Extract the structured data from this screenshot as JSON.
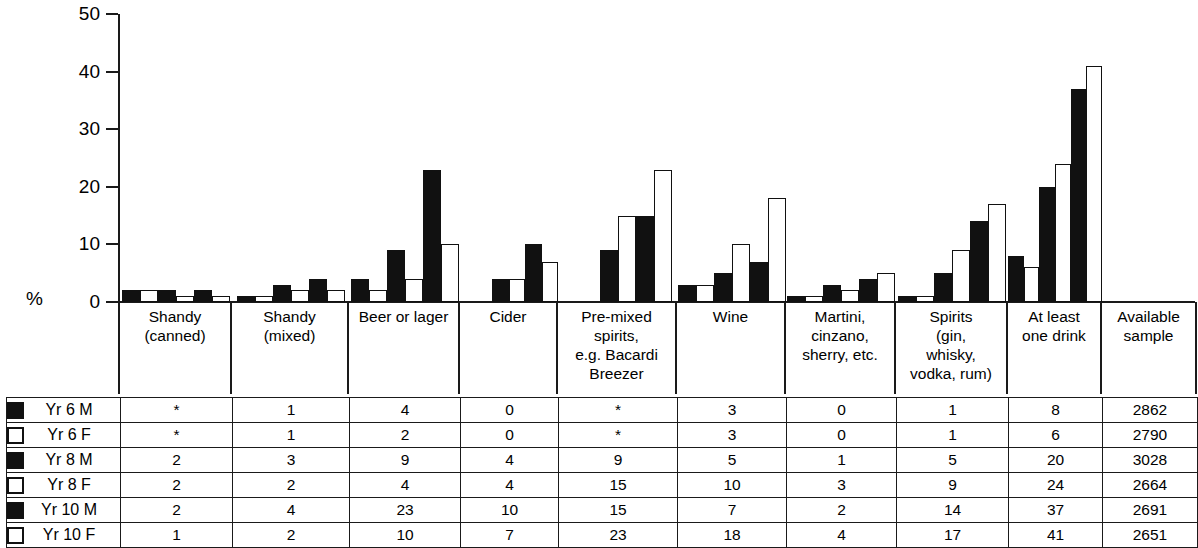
{
  "chart_data": {
    "type": "bar",
    "title": "",
    "subtitle": "",
    "xlabel": "",
    "ylabel": "%",
    "ylim": [
      0,
      50
    ],
    "yticks": [
      0,
      10,
      20,
      30,
      40,
      50
    ],
    "grid": false,
    "legend_position": "table-left",
    "orientation": "vertical-grouped",
    "categories": [
      "Shandy (canned)",
      "Shandy (mixed)",
      "Beer or lager",
      "Cider",
      "Pre-mixed spirits, e.g. Bacardi Breezer",
      "Wine",
      "Martini, cinzano, sherry, etc.",
      "Spirits (gin, whisky, vodka, rum)",
      "At least one drink"
    ],
    "series": [
      {
        "name": "Yr 6 M",
        "fill": "black",
        "values": [
          2,
          1,
          4,
          0,
          0,
          3,
          1,
          1,
          8
        ]
      },
      {
        "name": "Yr 6 F",
        "fill": "white",
        "values": [
          2,
          1,
          2,
          0,
          0,
          3,
          1,
          1,
          6
        ]
      },
      {
        "name": "Yr 8 M",
        "fill": "black",
        "values": [
          2,
          3,
          9,
          4,
          9,
          5,
          3,
          5,
          20
        ]
      },
      {
        "name": "Yr 8 F",
        "fill": "white",
        "values": [
          1,
          2,
          4,
          4,
          15,
          10,
          2,
          9,
          24
        ]
      },
      {
        "name": "Yr 10 M",
        "fill": "black",
        "values": [
          2,
          4,
          23,
          10,
          15,
          7,
          4,
          14,
          37
        ]
      },
      {
        "name": "Yr 10 F",
        "fill": "white",
        "values": [
          1,
          2,
          10,
          7,
          23,
          18,
          5,
          17,
          41
        ]
      }
    ]
  },
  "axis": {
    "percent_symbol": "%",
    "ticks": [
      {
        "label": "50"
      },
      {
        "label": "40"
      },
      {
        "label": "30"
      },
      {
        "label": "20"
      },
      {
        "label": "10"
      },
      {
        "label": "0"
      }
    ]
  },
  "categories": [
    {
      "lines": [
        "Shandy",
        "(canned)"
      ]
    },
    {
      "lines": [
        "Shandy",
        "(mixed)"
      ]
    },
    {
      "lines": [
        "Beer or lager"
      ]
    },
    {
      "lines": [
        "Cider"
      ]
    },
    {
      "lines": [
        "Pre-mixed",
        "spirits,",
        "e.g. Bacardi",
        "Breezer"
      ]
    },
    {
      "lines": [
        "Wine"
      ]
    },
    {
      "lines": [
        "Martini,",
        "cinzano,",
        "sherry,  etc."
      ]
    },
    {
      "lines": [
        "Spirits",
        "(gin,",
        "whisky,",
        "vodka, rum)"
      ]
    },
    {
      "lines": [
        "At least",
        "one drink"
      ]
    },
    {
      "lines": [
        "Available",
        "sample"
      ]
    }
  ],
  "table": {
    "rows": [
      {
        "swatch": "black",
        "label": "Yr 6 M",
        "cells": [
          "*",
          "1",
          "4",
          "0",
          "*",
          "3",
          "0",
          "1",
          "8",
          "2862"
        ]
      },
      {
        "swatch": "white",
        "label": "Yr 6 F",
        "cells": [
          "*",
          "1",
          "2",
          "0",
          "*",
          "3",
          "0",
          "1",
          "6",
          "2790"
        ]
      },
      {
        "swatch": "black",
        "label": "Yr 8 M",
        "cells": [
          "2",
          "3",
          "9",
          "4",
          "9",
          "5",
          "1",
          "5",
          "20",
          "3028"
        ]
      },
      {
        "swatch": "white",
        "label": "Yr 8 F",
        "cells": [
          "2",
          "2",
          "4",
          "4",
          "15",
          "10",
          "3",
          "9",
          "24",
          "2664"
        ]
      },
      {
        "swatch": "black",
        "label": "Yr 10 M",
        "cells": [
          "2",
          "4",
          "23",
          "10",
          "15",
          "7",
          "2",
          "14",
          "37",
          "2691"
        ]
      },
      {
        "swatch": "white",
        "label": "Yr 10 F",
        "cells": [
          "1",
          "2",
          "10",
          "7",
          "23",
          "18",
          "4",
          "17",
          "41",
          "2651"
        ]
      }
    ]
  },
  "colors": {
    "male_series": "#111111",
    "female_series": "#ffffff",
    "line": "#1a1a1a"
  }
}
